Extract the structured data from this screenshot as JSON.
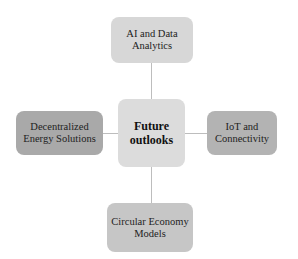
{
  "diagram": {
    "type": "hub-and-spoke",
    "center": {
      "label": "Future outlooks",
      "color": "#dcdcdc"
    },
    "nodes": [
      {
        "position": "top",
        "label": "AI and Data Analytics",
        "color": "#d7d7d7"
      },
      {
        "position": "left",
        "label": "Decentralized Energy Solutions",
        "color": "#a9a9a9"
      },
      {
        "position": "right",
        "label": "IoT and Connectivity",
        "color": "#b3b3b3"
      },
      {
        "position": "bottom",
        "label": "Circular Economy Models",
        "color": "#c6c6c6"
      }
    ],
    "connector_color": "#bdbdbd"
  }
}
